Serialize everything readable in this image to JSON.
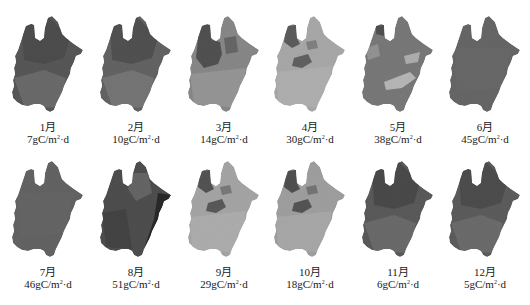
{
  "figure": {
    "unit_prefix": "gC/m",
    "unit_exp": "2",
    "unit_suffix": "·d"
  },
  "panels": [
    {
      "month": "1月",
      "value": "7",
      "tone": "#4a4a4a",
      "tone2": "#6e6e6e",
      "tone3": "#3a3a3a",
      "pattern": "dark-north"
    },
    {
      "month": "2月",
      "value": "10",
      "tone": "#5a5a5a",
      "tone2": "#7c7c7c",
      "tone3": "#3e3e3e",
      "pattern": "dark-north"
    },
    {
      "month": "3月",
      "value": "14",
      "tone": "#8a8a8a",
      "tone2": "#a8a8a8",
      "tone3": "#3a3a3a",
      "pattern": "dark-northwest"
    },
    {
      "month": "4月",
      "value": "30",
      "tone": "#b4b4b4",
      "tone2": "#c6c6c6",
      "tone3": "#404040",
      "pattern": "dark-northwest-small"
    },
    {
      "month": "5月",
      "value": "38",
      "tone": "#767676",
      "tone2": "#a6a6a6",
      "tone3": "#d0d0d0",
      "pattern": "light-patches"
    },
    {
      "month": "6月",
      "value": "45",
      "tone": "#5e5e5e",
      "tone2": "#6a6a6a",
      "tone3": "#505050",
      "pattern": "uniform"
    },
    {
      "month": "7月",
      "value": "46",
      "tone": "#5a5a5a",
      "tone2": "#666666",
      "tone3": "#4e4e4e",
      "pattern": "uniform"
    },
    {
      "month": "8月",
      "value": "51",
      "tone": "#3e3e3e",
      "tone2": "#6a6a6a",
      "tone3": "#0e0e0e",
      "pattern": "dark-east-edge"
    },
    {
      "month": "9月",
      "value": "29",
      "tone": "#b0b0b0",
      "tone2": "#c4c4c4",
      "tone3": "#333333",
      "pattern": "dark-northwest-small"
    },
    {
      "month": "10月",
      "value": "18",
      "tone": "#a8a8a8",
      "tone2": "#bdbdbd",
      "tone3": "#2e2e2e",
      "pattern": "dark-northwest-small"
    },
    {
      "month": "11月",
      "value": "6",
      "tone": "#4e4e4e",
      "tone2": "#6c6c6c",
      "tone3": "#363636",
      "pattern": "dark-north"
    },
    {
      "month": "12月",
      "value": "5",
      "tone": "#505050",
      "tone2": "#6e6e6e",
      "tone3": "#383838",
      "pattern": "dark-north"
    }
  ],
  "chart_data": {
    "type": "heatmap",
    "title": "",
    "layout": "small multiples, 2 rows × 6 columns of regional grayscale maps",
    "categories": [
      "1月",
      "2月",
      "3月",
      "4月",
      "5月",
      "6月",
      "7月",
      "8月",
      "9月",
      "10月",
      "11月",
      "12月"
    ],
    "values": [
      7,
      10,
      14,
      30,
      38,
      45,
      46,
      51,
      29,
      18,
      6,
      5
    ],
    "unit": "gC/m²·d",
    "xlabel": "",
    "ylabel": "",
    "legend": "none",
    "grid": false
  }
}
